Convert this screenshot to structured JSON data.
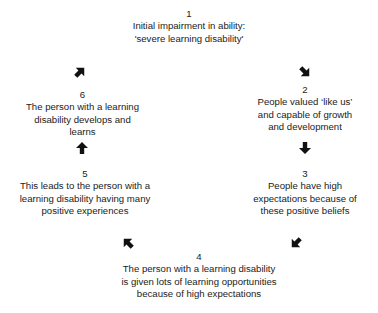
{
  "diagram": {
    "type": "cycle",
    "nodes": [
      {
        "number": "1",
        "lines": [
          "Initial impairment in ability:",
          "'severe learning disability'"
        ]
      },
      {
        "number": "2",
        "lines": [
          "People valued ‘like us’",
          "and capable of growth",
          "and development"
        ]
      },
      {
        "number": "3",
        "lines": [
          "People have high",
          "expectations because of",
          "these positive beliefs"
        ]
      },
      {
        "number": "4",
        "lines": [
          "The person with a learning disability",
          "is given lots of learning opportunities",
          "because of high expectations"
        ]
      },
      {
        "number": "5",
        "lines": [
          "This leads to the person with a",
          "learning disability having many",
          "positive experiences"
        ]
      },
      {
        "number": "6",
        "lines": [
          "The person with a learning",
          "disability develops and",
          "learns"
        ]
      }
    ],
    "arrows": [
      {
        "from": "1",
        "to": "2",
        "icon": "arrow-down-right"
      },
      {
        "from": "2",
        "to": "3",
        "icon": "arrow-down"
      },
      {
        "from": "3",
        "to": "4",
        "icon": "arrow-down-left"
      },
      {
        "from": "4",
        "to": "5",
        "icon": "arrow-up-left"
      },
      {
        "from": "5",
        "to": "6",
        "icon": "arrow-up"
      },
      {
        "from": "6",
        "to": "1",
        "icon": "arrow-up-right"
      }
    ],
    "arrow_color": "#111111",
    "text_color": "#222222"
  }
}
